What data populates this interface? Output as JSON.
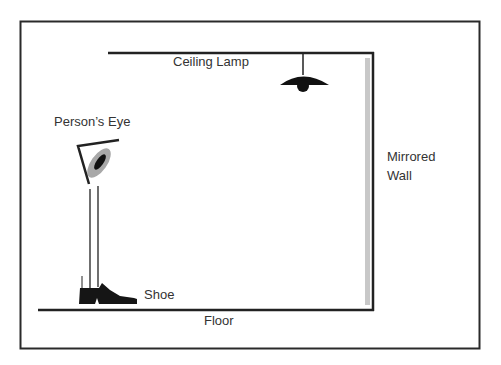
{
  "diagram": {
    "labels": {
      "ceiling_lamp": "Ceiling Lamp",
      "persons_eye": "Person’s Eye",
      "mirrored_wall_line1": "Mirrored",
      "mirrored_wall_line2": "Wall",
      "shoe": "Shoe",
      "floor": "Floor"
    },
    "colors": {
      "line": "#222222",
      "mirror": "#c8c8c8",
      "eye_iris": "#a8a8a8",
      "pupil": "#111111",
      "background": "#ffffff"
    }
  }
}
